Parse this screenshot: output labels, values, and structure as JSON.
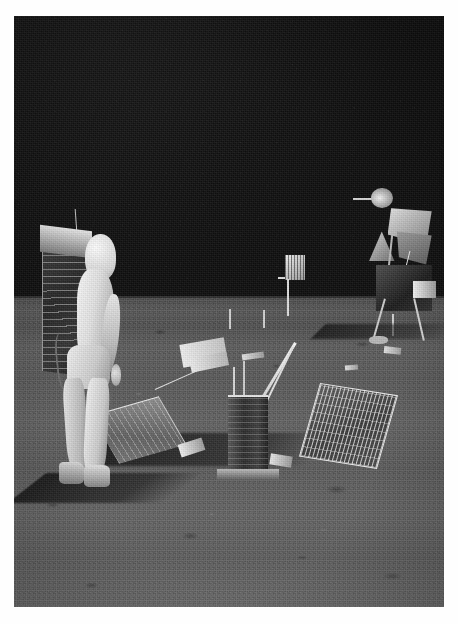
{
  "photograph": {
    "title": "Apollo 11 lunar surface photograph",
    "subject": "Astronaut in white EVA suit deploying lunar surface experiment package",
    "medium": "Black and white photographic print with white border",
    "border_color": "#ffffff",
    "dimensions": {
      "width": 458,
      "height": 624
    },
    "print_area": {
      "left": 14,
      "top": 16,
      "width": 430,
      "height": 591
    }
  },
  "scene": {
    "sky": {
      "label": "Black lunar sky",
      "color": "#0c0c0c",
      "description": "Airless black sky occupying the upper half of the frame, no stars visible"
    },
    "horizon": {
      "label": "Lunar horizon",
      "color": "#3a3a3a",
      "description": "Flat, slightly raised horizon line crossing the frame at roughly the vertical midpoint"
    },
    "ground": {
      "label": "Lunar regolith surface",
      "color": "#5c5c5c",
      "description": "Mid-grey cratered soil with scattered small rocks, boot prints and rover-less tracks"
    },
    "lighting": {
      "label": "Low sun from the right",
      "shadow_color": "#161616",
      "description": "Long hard shadows cast to the left across the foreground"
    }
  },
  "subjects": [
    {
      "id": "astronaut",
      "name": "Astronaut in EVA suit",
      "position": "left of centre, standing on the regolith",
      "parts": [
        {
          "name": "PLSS backpack",
          "color": "#2b2b2b",
          "description": "Dark rectangular life support backpack with bright top edge"
        },
        {
          "name": "Communications antenna",
          "color": "#c9c9c9",
          "description": "Thin whip antenna rising from the backpack"
        },
        {
          "name": "Helmet",
          "color": "#e8e8e8",
          "description": "White helmet shell, face turned away from camera"
        },
        {
          "name": "Pressure suit torso",
          "color": "#e7e7e7",
          "description": "Brilliant white suit body"
        },
        {
          "name": "Right arm and glove",
          "color": "#cfcfcf",
          "description": "Arm hanging at side with gloved hand"
        },
        {
          "name": "Legs",
          "color": "#dcdcdc",
          "description": "Both legs visible, left leg slightly forward"
        },
        {
          "name": "Lunar overboots",
          "color": "#b4b4b4",
          "description": "Grey-white overboots on the soil"
        },
        {
          "name": "Cast shadow",
          "color": "#141414",
          "description": "Long dark shadow stretching left across the surface"
        }
      ]
    },
    {
      "id": "alsep-central-station",
      "name": "Lunar surface experiment package (seismometer central station)",
      "position": "centre of frame, just below the horizon",
      "parts": [
        {
          "name": "Cylindrical instrument body",
          "color": "#343434",
          "description": "Dark ribbed cylinder with bright white top plate"
        },
        {
          "name": "Deployment boom",
          "color": "#f2f2f2",
          "description": "White diagonal mast running up to the right"
        },
        {
          "name": "White sub-assemblies",
          "color": "#ededed",
          "description": "Cluster of small white boxes on the upper left"
        },
        {
          "name": "Base plate and feet",
          "color": "#a8a8a8",
          "description": "Light base resting on the soil"
        },
        {
          "name": "Equipment shadow",
          "color": "#171717",
          "description": "Dark shadow pooled beneath and to the left"
        }
      ]
    },
    {
      "id": "solar-panel-right",
      "name": "Right deployed solar array",
      "color": "#444444",
      "description": "Rectangular grid-celled solar panel tilted up, bright white frame, to the right of the central station"
    },
    {
      "id": "solar-panel-left",
      "name": "Left deployed solar array",
      "color": "#777777",
      "description": "Second solar panel angled away to the left, catching more sunlight, with a support strut above it"
    },
    {
      "id": "lunar-module",
      "name": "Lunar Module",
      "position": "right edge of frame, partly cropped",
      "parts": [
        {
          "name": "Rendezvous radar antenna",
          "color": "#f0f0f0",
          "description": "Small dish on a boom at the top of the ascent stage"
        },
        {
          "name": "Thermal foil panels",
          "color": "#cfcfcf",
          "description": "Bright crinkled foil facets catching the sun"
        },
        {
          "name": "Descent stage body",
          "color": "#262626",
          "description": "Dark boxy descent stage in shadow"
        },
        {
          "name": "Landing legs and pads",
          "color": "#cccccc",
          "description": "Bright struts descending to footpads on the soil"
        },
        {
          "name": "Module shadow",
          "color": "#1a1a1a",
          "description": "Shadow stretching to the left of the lander"
        }
      ]
    },
    {
      "id": "lrrr-marker",
      "name": "Instrument on a pole",
      "color": "#dddddd",
      "description": "Small bright slatted instrument head mounted on a thin vertical pole, standing on the horizon near centre-right"
    }
  ],
  "colors": {
    "border": "#ffffff",
    "sky": "#0c0c0c",
    "regolith_light": "#6a6a6a",
    "regolith_mid": "#5c5c5c",
    "regolith_dark": "#3f3f3f",
    "shadow": "#151515",
    "suit_white": "#f2f2f2",
    "highlight": "#ffffff"
  }
}
